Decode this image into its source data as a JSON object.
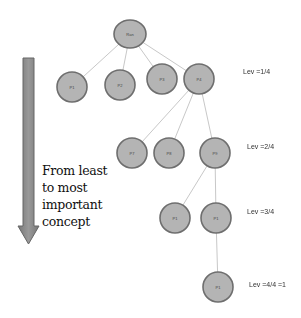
{
  "diagram": {
    "arrow_caption": [
      "From least",
      "to most",
      "important",
      "concept"
    ],
    "levels": [
      {
        "label": "Lev =1/4"
      },
      {
        "label": "Lev =2/4"
      },
      {
        "label": "Lev =3/4"
      },
      {
        "label": "Lev =4/4 =1"
      }
    ],
    "nodes": [
      {
        "id": "root",
        "label": "Ran",
        "level": 0,
        "parent": null
      },
      {
        "id": "n1",
        "label": "P1",
        "level": 1,
        "parent": "root"
      },
      {
        "id": "n2",
        "label": "P2",
        "level": 1,
        "parent": "root"
      },
      {
        "id": "n3",
        "label": "P3",
        "level": 1,
        "parent": "root"
      },
      {
        "id": "n4",
        "label": "P4",
        "level": 1,
        "parent": "root"
      },
      {
        "id": "n5",
        "label": "P7",
        "level": 2,
        "parent": "n4"
      },
      {
        "id": "n6",
        "label": "P8",
        "level": 2,
        "parent": "n4"
      },
      {
        "id": "n7",
        "label": "P9",
        "level": 2,
        "parent": "n4"
      },
      {
        "id": "n8",
        "label": "P1",
        "level": 3,
        "parent": "n7"
      },
      {
        "id": "n9",
        "label": "P1",
        "level": 3,
        "parent": "n7"
      },
      {
        "id": "n10",
        "label": "P1",
        "level": 4,
        "parent": "n9"
      }
    ],
    "colors": {
      "node_fill": "#b4b4b4",
      "node_stroke": "#6e6e6e",
      "edge": "#c8c8c8",
      "arrow_fill": "#8a8a8a",
      "arrow_stroke": "#6a6a6a"
    }
  }
}
